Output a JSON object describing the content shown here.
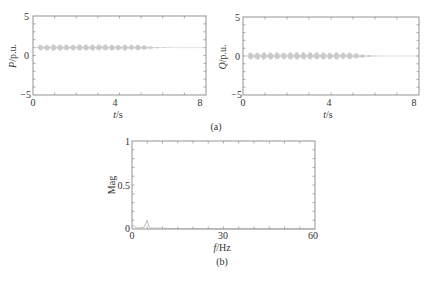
{
  "chart_data": [
    {
      "id": "a-left",
      "type": "line",
      "panel": "(a)",
      "title": "",
      "xlabel": "t/s",
      "ylabel": "P/p.u.",
      "xlim": [
        0,
        8
      ],
      "ylim": [
        -5,
        5
      ],
      "xticks": [
        "0",
        "4",
        "8"
      ],
      "yticks": [
        "5",
        "0",
        "-5"
      ],
      "grid": false,
      "series": [
        {
          "name": "P",
          "description": "oscillation band about 0.6 to 1.4 p.u. from ~0.2 s to ~5 s, decaying ringing until ~6 s, then flat at 1 p.u. to 8 s",
          "x": [
            0.2,
            1,
            2,
            3,
            4,
            5,
            5.5,
            6,
            7,
            8
          ],
          "y_mean": [
            1,
            1,
            1,
            1,
            1,
            1,
            1,
            1,
            1,
            1
          ],
          "y_amplitude": [
            0.4,
            0.45,
            0.4,
            0.45,
            0.4,
            0.4,
            0.15,
            0.05,
            0,
            0
          ]
        }
      ]
    },
    {
      "id": "a-right",
      "type": "line",
      "panel": "(a)",
      "title": "",
      "xlabel": "t/s",
      "ylabel": "Q/p.u.",
      "xlim": [
        0,
        8
      ],
      "ylim": [
        -5,
        5
      ],
      "xticks": [
        "0",
        "4",
        "8"
      ],
      "yticks": [
        "5",
        "0",
        "-5"
      ],
      "grid": false,
      "series": [
        {
          "name": "Q",
          "description": "oscillation about 0 p.u. with amplitude ~0.5 from ~0.2 s to ~5 s, decaying ringing until ~6 s, then flat at 0",
          "x": [
            0.2,
            1,
            2,
            3,
            4,
            5,
            5.5,
            6,
            7,
            8
          ],
          "y_mean": [
            0,
            0,
            0,
            0,
            0,
            0,
            0,
            0,
            0,
            0
          ],
          "y_amplitude": [
            0.5,
            0.55,
            0.5,
            0.55,
            0.5,
            0.5,
            0.2,
            0.05,
            0,
            0
          ]
        }
      ]
    },
    {
      "id": "b",
      "type": "line",
      "panel": "(b)",
      "title": "",
      "xlabel": "f/Hz",
      "ylabel": "Mag",
      "xlim": [
        0,
        60
      ],
      "ylim": [
        0,
        1
      ],
      "xticks": [
        "0",
        "30",
        "60"
      ],
      "yticks": [
        "1",
        "0.5",
        "0"
      ],
      "grid": false,
      "series": [
        {
          "name": "Spectrum",
          "x": [
            0,
            0.5,
            1,
            2,
            3,
            4,
            5,
            5.5,
            6,
            7,
            8,
            10,
            15,
            20,
            30,
            40,
            50,
            60
          ],
          "y": [
            0.03,
            0.04,
            0.02,
            0.01,
            0.015,
            0.02,
            0.1,
            0.03,
            0.01,
            0.01,
            0.01,
            0.008,
            0.004,
            0.003,
            0.002,
            0.001,
            0.001,
            0.001
          ]
        }
      ]
    }
  ],
  "labels": {
    "a_left": {
      "ylabel_italic": "P",
      "ylabel_rest": "/p.u.",
      "xlabel_italic": "t",
      "xlabel_rest": "/s",
      "yticks": [
        "5",
        "0",
        "−5"
      ],
      "xticks": [
        "0",
        "4",
        "8"
      ]
    },
    "a_right": {
      "ylabel_italic": "Q",
      "ylabel_rest": "/p.u.",
      "xlabel_italic": "t",
      "xlabel_rest": "/s",
      "yticks": [
        "5",
        "0",
        "−5"
      ],
      "xticks": [
        "0",
        "4",
        "8"
      ]
    },
    "b": {
      "ylabel": "Mag",
      "xlabel_italic": "f",
      "xlabel_rest": "/Hz",
      "yticks": [
        "1",
        "0.5",
        "0"
      ],
      "xticks": [
        "0",
        "30",
        "60"
      ]
    },
    "panel_a": "(a)",
    "panel_b": "(b)"
  }
}
